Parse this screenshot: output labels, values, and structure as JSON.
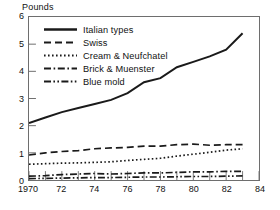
{
  "chart_data": {
    "type": "line",
    "title": "",
    "xlabel": "",
    "ylabel": "Pounds",
    "xlim": [
      1970,
      1984
    ],
    "ylim": [
      0,
      6
    ],
    "grid": false,
    "legend_position": "upper-left-inside",
    "x": [
      1970,
      1971,
      1972,
      1973,
      1974,
      1975,
      1976,
      1977,
      1978,
      1979,
      1980,
      1981,
      1982,
      1983
    ],
    "x_tick_labels": [
      "1970",
      "72",
      "74",
      "76",
      "78",
      "80",
      "82",
      "84"
    ],
    "x_tick_values": [
      1970,
      1972,
      1974,
      1976,
      1978,
      1980,
      1982,
      1984
    ],
    "y_tick_labels": [
      "0",
      "1",
      "2",
      "3",
      "4",
      "5",
      "6"
    ],
    "y_tick_values": [
      0,
      1,
      2,
      3,
      4,
      5,
      6
    ],
    "series": [
      {
        "name": "Italian types",
        "style": "solid",
        "values": [
          2.1,
          2.3,
          2.5,
          2.65,
          2.8,
          2.95,
          3.2,
          3.6,
          3.75,
          4.15,
          4.35,
          4.55,
          4.8,
          5.4
        ]
      },
      {
        "name": "Swiss",
        "style": "dashed",
        "values": [
          0.92,
          1.0,
          1.05,
          1.08,
          1.15,
          1.18,
          1.2,
          1.25,
          1.25,
          1.3,
          1.32,
          1.28,
          1.3,
          1.3
        ]
      },
      {
        "name": "Cream & Neufchatel",
        "style": "dotted",
        "values": [
          0.58,
          0.6,
          0.62,
          0.63,
          0.65,
          0.67,
          0.72,
          0.76,
          0.8,
          0.88,
          0.95,
          1.02,
          1.1,
          1.15
        ]
      },
      {
        "name": "Brick & Muenster",
        "style": "dash-dot",
        "values": [
          0.14,
          0.16,
          0.2,
          0.22,
          0.24,
          0.22,
          0.24,
          0.26,
          0.26,
          0.28,
          0.3,
          0.3,
          0.32,
          0.32
        ]
      },
      {
        "name": "Blue mold",
        "style": "dash-dot-dot",
        "values": [
          0.05,
          0.06,
          0.07,
          0.08,
          0.09,
          0.09,
          0.1,
          0.11,
          0.11,
          0.12,
          0.13,
          0.13,
          0.14,
          0.15
        ]
      }
    ],
    "colors": {
      "line": "#1a1a1a",
      "axis": "#6e6e6e",
      "background": "#ffffff"
    }
  }
}
